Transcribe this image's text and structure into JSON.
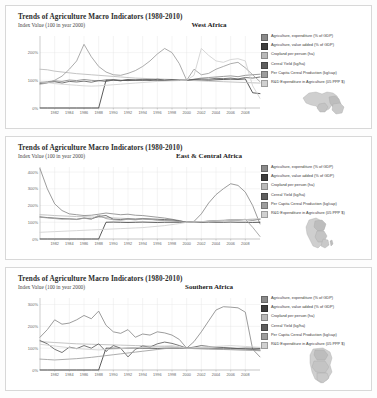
{
  "document": {
    "kind": "figure-sheet",
    "background": "#fdfdfd"
  },
  "panels": [
    {
      "id": "west-africa",
      "title": "Trends of Agriculture Macro Indicators (1980-2010)",
      "subtitle": "Index Value (100 in year 2000)",
      "region": "West Africa",
      "map_name": "west-africa-map"
    },
    {
      "id": "east-central-africa",
      "title": "Trends of Agriculture Macro Indicators (1980-2010)",
      "subtitle": "Index Value (100 in year 2000)",
      "region": "East & Central Africa",
      "map_name": "east-central-africa-map"
    },
    {
      "id": "southern-africa",
      "title": "Trends of Agriculture Macro Indicators (1980-2010)",
      "subtitle": "Index Value (100 in year 2000)",
      "region": "Southern Africa",
      "map_name": "southern-africa-map"
    }
  ],
  "legend_entries": [
    {
      "label": "Agriculture, expenditure (% of GDP)",
      "color": "#8a8a8a"
    },
    {
      "label": "Agriculture, value added (% of GDP)",
      "color": "#3d3d3d"
    },
    {
      "label": "Cropland per person (ha)",
      "color": "#b9b9b9"
    },
    {
      "label": "Cereal Yield (kg/ha)",
      "color": "#5e5e5e"
    },
    {
      "label": "Per Capita Cereal Production (kg/cap)",
      "color": "#9d9d9d"
    },
    {
      "label": "R&D Expenditure in Agriculture (05 PPP $)",
      "color": "#d0d0d0"
    }
  ],
  "chart_data": [
    {
      "type": "line",
      "title": "Trends of Agriculture Macro Indicators (1980-2010)",
      "subtitle": "Index Value (100 in year 2000)",
      "region": "West Africa",
      "xlabel": "",
      "ylabel": "Index Value (100 in year 2000)",
      "xlim": [
        1980,
        2010
      ],
      "ylim": [
        0,
        260
      ],
      "yticks": [
        0,
        100,
        200
      ],
      "ytick_labels": [
        "0%",
        "100%",
        "200%"
      ],
      "xticks": [
        1982,
        1984,
        1986,
        1988,
        1990,
        1992,
        1994,
        1996,
        1998,
        2000,
        2002,
        2004,
        2006,
        2008
      ],
      "grid": true,
      "legend_position": "right",
      "x": [
        1980,
        1981,
        1982,
        1983,
        1984,
        1985,
        1986,
        1987,
        1988,
        1989,
        1990,
        1991,
        1992,
        1993,
        1994,
        1995,
        1996,
        1997,
        1998,
        1999,
        2000,
        2001,
        2002,
        2003,
        2004,
        2005,
        2006,
        2007,
        2008,
        2009,
        2010
      ],
      "series": [
        {
          "name": "Agriculture, expenditure (% of GDP)",
          "color": "#8a8a8a",
          "values": [
            92,
            95,
            98,
            96,
            101,
            99,
            103,
            100,
            98,
            102,
            100,
            99,
            103,
            101,
            104,
            102,
            100,
            99,
            103,
            101,
            100,
            104,
            108,
            110,
            112,
            114,
            116,
            113,
            118,
            120,
            122
          ]
        },
        {
          "name": "Agriculture, value added (% of GDP)",
          "color": "#3d3d3d",
          "values": [
            0,
            0,
            0,
            0,
            0,
            0,
            0,
            0,
            0,
            100,
            102,
            100,
            99,
            101,
            100,
            102,
            101,
            100,
            100,
            100,
            100,
            102,
            101,
            100,
            102,
            103,
            104,
            103,
            105,
            55,
            52
          ]
        },
        {
          "name": "Cropland per person (ha)",
          "color": "#b9b9b9",
          "values": [
            140,
            138,
            133,
            130,
            127,
            124,
            122,
            120,
            118,
            116,
            114,
            112,
            110,
            108,
            107,
            106,
            105,
            104,
            103,
            102,
            100,
            99,
            98,
            97,
            96,
            95,
            94,
            93,
            92,
            91,
            90
          ]
        },
        {
          "name": "Cereal Yield (kg/ha)",
          "color": "#5e5e5e",
          "values": [
            88,
            92,
            95,
            90,
            96,
            94,
            97,
            93,
            99,
            96,
            101,
            98,
            103,
            100,
            102,
            99,
            104,
            101,
            103,
            100,
            100,
            103,
            105,
            104,
            107,
            106,
            108,
            105,
            110,
            108,
            112
          ]
        },
        {
          "name": "Per Capita Cereal Production (kg/cap)",
          "color": "#9d9d9d",
          "values": [
            86,
            90,
            100,
            115,
            140,
            170,
            230,
            185,
            150,
            130,
            120,
            118,
            125,
            135,
            150,
            170,
            195,
            215,
            200,
            160,
            100,
            140,
            120,
            125,
            140,
            150,
            160,
            165,
            145,
            120,
            95
          ]
        },
        {
          "name": "R&D Expenditure in Agriculture (05 PPP $)",
          "color": "#d0d0d0",
          "values": [
            95,
            92,
            88,
            86,
            84,
            82,
            80,
            79,
            80,
            82,
            84,
            86,
            88,
            90,
            92,
            94,
            96,
            97,
            98,
            99,
            100,
            118,
            215,
            190,
            170,
            165,
            175,
            178,
            170,
            80,
            35
          ]
        }
      ]
    },
    {
      "type": "line",
      "title": "Trends of Agriculture Macro Indicators (1980-2010)",
      "subtitle": "Index Value (100 in year 2000)",
      "region": "East & Central Africa",
      "xlabel": "",
      "ylabel": "Index Value (100 in year 2000)",
      "xlim": [
        1980,
        2010
      ],
      "ylim": [
        0,
        430
      ],
      "yticks": [
        0,
        100,
        200,
        300,
        400
      ],
      "ytick_labels": [
        "0%",
        "100%",
        "200%",
        "300%",
        "400%"
      ],
      "xticks": [
        1982,
        1984,
        1986,
        1988,
        1990,
        1992,
        1994,
        1996,
        1998,
        2000,
        2002,
        2004,
        2006,
        2008
      ],
      "grid": true,
      "legend_position": "right",
      "x": [
        1980,
        1981,
        1982,
        1983,
        1984,
        1985,
        1986,
        1987,
        1988,
        1989,
        1990,
        1991,
        1992,
        1993,
        1994,
        1995,
        1996,
        1997,
        1998,
        1999,
        2000,
        2001,
        2002,
        2003,
        2004,
        2005,
        2006,
        2007,
        2008,
        2009,
        2010
      ],
      "series": [
        {
          "name": "Agriculture, expenditure (% of GDP)",
          "color": "#8a8a8a",
          "values": [
            420,
            300,
            210,
            170,
            150,
            145,
            140,
            142,
            148,
            155,
            150,
            145,
            148,
            142,
            140,
            135,
            130,
            125,
            118,
            110,
            100,
            105,
            150,
            215,
            265,
            300,
            330,
            320,
            280,
            200,
            90
          ]
        },
        {
          "name": "Agriculture, value added (% of GDP)",
          "color": "#3d3d3d",
          "values": [
            0,
            0,
            0,
            0,
            0,
            0,
            0,
            0,
            0,
            100,
            101,
            100,
            99,
            100,
            101,
            100,
            99,
            100,
            100,
            100,
            100,
            101,
            100,
            101,
            100,
            100,
            101,
            100,
            100,
            99,
            100
          ]
        },
        {
          "name": "Cropland per person (ha)",
          "color": "#b9b9b9",
          "values": [
            145,
            143,
            140,
            138,
            136,
            134,
            133,
            131,
            130,
            128,
            126,
            124,
            122,
            120,
            118,
            116,
            114,
            112,
            110,
            105,
            100,
            102,
            104,
            106,
            108,
            110,
            112,
            114,
            116,
            118,
            120
          ]
        },
        {
          "name": "Cereal Yield (kg/ha)",
          "color": "#5e5e5e",
          "values": [
            132,
            128,
            125,
            122,
            120,
            118,
            125,
            120,
            135,
            140,
            118,
            116,
            120,
            118,
            122,
            120,
            118,
            116,
            114,
            108,
            100,
            104,
            102,
            106,
            108,
            110,
            112,
            114,
            116,
            112,
            118
          ]
        },
        {
          "name": "Per Capita Cereal Production (kg/cap)",
          "color": "#9d9d9d",
          "values": [
            130,
            126,
            122,
            118,
            120,
            116,
            124,
            118,
            142,
            122,
            115,
            112,
            118,
            114,
            120,
            118,
            112,
            110,
            108,
            104,
            100,
            105,
            103,
            107,
            110,
            112,
            115,
            112,
            118,
            70,
            15
          ]
        },
        {
          "name": "R&D Expenditure in Agriculture (05 PPP $)",
          "color": "#d0d0d0",
          "values": [
            40,
            42,
            44,
            46,
            48,
            50,
            52,
            54,
            56,
            58,
            60,
            62,
            64,
            66,
            68,
            72,
            76,
            80,
            86,
            92,
            100,
            102,
            104,
            106,
            108,
            110,
            112,
            114,
            116,
            118,
            120
          ]
        }
      ]
    },
    {
      "type": "line",
      "title": "Trends of Agriculture Macro Indicators (1980-2010)",
      "subtitle": "Index Value (100 in year 2000)",
      "region": "Southern Africa",
      "xlabel": "",
      "ylabel": "Index Value (100 in year 2000)",
      "xlim": [
        1980,
        2010
      ],
      "ylim": [
        0,
        330
      ],
      "yticks": [
        0,
        100,
        200,
        300
      ],
      "ytick_labels": [
        "0%",
        "100%",
        "200%",
        "300%"
      ],
      "xticks": [
        1982,
        1984,
        1986,
        1988,
        1990,
        1992,
        1994,
        1996,
        1998,
        2000,
        2002,
        2004,
        2006,
        2008
      ],
      "grid": true,
      "legend_position": "right",
      "x": [
        1980,
        1981,
        1982,
        1983,
        1984,
        1985,
        1986,
        1987,
        1988,
        1989,
        1990,
        1991,
        1992,
        1993,
        1994,
        1995,
        1996,
        1997,
        1998,
        1999,
        2000,
        2001,
        2002,
        2003,
        2004,
        2005,
        2006,
        2007,
        2008,
        2009,
        2010
      ],
      "series": [
        {
          "name": "Agriculture, expenditure (% of GDP)",
          "color": "#8a8a8a",
          "values": [
            150,
            185,
            230,
            210,
            215,
            230,
            250,
            235,
            270,
            205,
            175,
            168,
            185,
            150,
            165,
            160,
            175,
            170,
            160,
            140,
            100,
            130,
            175,
            225,
            275,
            290,
            288,
            285,
            265,
            95,
            60
          ]
        },
        {
          "name": "Agriculture, value added (% of GDP)",
          "color": "#3d3d3d",
          "values": [
            0,
            0,
            0,
            0,
            0,
            0,
            0,
            0,
            0,
            100,
            100,
            99,
            100,
            101,
            100,
            100,
            99,
            100,
            100,
            100,
            100,
            99,
            100,
            100,
            99,
            100,
            100,
            99,
            100,
            100,
            99
          ]
        },
        {
          "name": "Cropland per person (ha)",
          "color": "#b9b9b9",
          "values": [
            130,
            128,
            126,
            124,
            122,
            120,
            119,
            118,
            117,
            116,
            115,
            114,
            113,
            112,
            111,
            110,
            109,
            108,
            107,
            104,
            100,
            99,
            98,
            97,
            96,
            95,
            94,
            93,
            92,
            91,
            90
          ]
        },
        {
          "name": "Cereal Yield (kg/ha)",
          "color": "#5e5e5e",
          "values": [
            135,
            120,
            95,
            80,
            105,
            98,
            112,
            100,
            120,
            85,
            112,
            100,
            60,
            95,
            110,
            105,
            120,
            128,
            122,
            112,
            100,
            105,
            112,
            108,
            105,
            103,
            100,
            98,
            96,
            94,
            92
          ]
        },
        {
          "name": "Per Capita Cereal Production (kg/cap)",
          "color": "#9d9d9d",
          "values": [
            50,
            48,
            46,
            48,
            50,
            52,
            55,
            58,
            62,
            66,
            70,
            74,
            78,
            82,
            86,
            90,
            94,
            98,
            100,
            100,
            100,
            98,
            97,
            96,
            95,
            94,
            93,
            92,
            91,
            90,
            88
          ]
        },
        {
          "name": "R&D Expenditure in Agriculture (05 PPP $)",
          "color": "#d0d0d0",
          "values": [
            118,
            114,
            110,
            106,
            102,
            98,
            96,
            94,
            92,
            94,
            96,
            98,
            100,
            102,
            104,
            106,
            108,
            110,
            112,
            106,
            100,
            102,
            104,
            106,
            108,
            110,
            112,
            110,
            108,
            106,
            104
          ]
        }
      ]
    }
  ]
}
